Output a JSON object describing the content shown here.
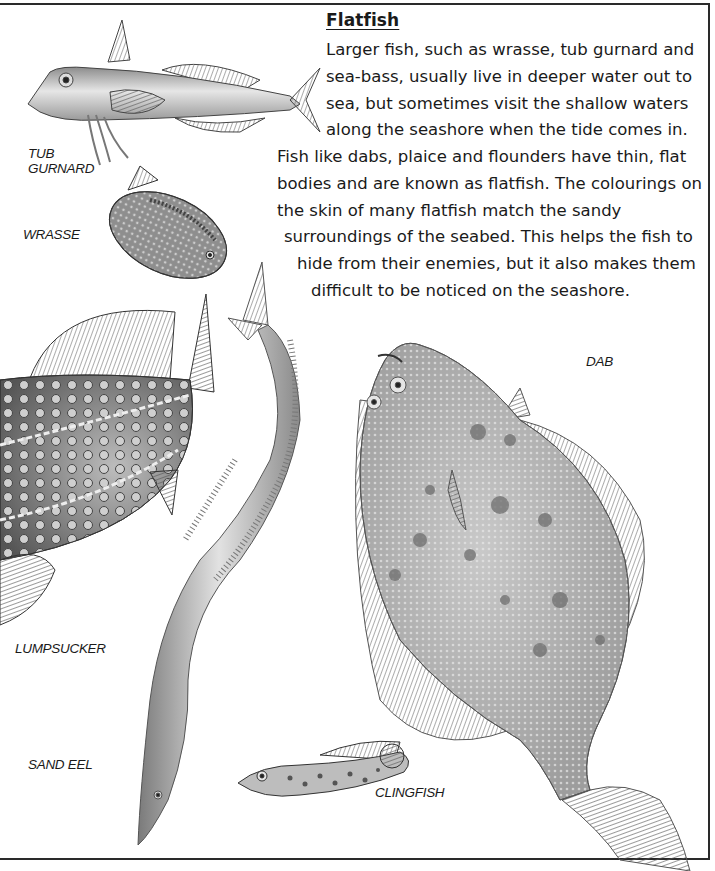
{
  "page": {
    "heading": "Flatfish",
    "paragraph_lines": [
      "Larger fish, such as wrasse, tub gurnard and",
      "sea-bass, usually live in deeper water out to",
      "sea, but sometimes visit the shallow waters",
      "along the seashore when the tide comes in.",
      "Fish like dabs, plaice and flounders have thin, flat",
      "bodies and are known as flatfish. The colourings on",
      "the skin of many flatfish match the sandy",
      "surroundings of the seabed. This helps the fish to",
      "hide from their enemies, but it also makes them",
      "difficult to be noticed on the seashore."
    ]
  },
  "illustrations": [
    {
      "id": "tub-gurnard",
      "label_lines": [
        "TUB",
        "GURNARD"
      ]
    },
    {
      "id": "wrasse",
      "label_lines": [
        "WRASSE"
      ]
    },
    {
      "id": "lumpsucker",
      "label_lines": [
        "LUMPSUCKER"
      ]
    },
    {
      "id": "sand-eel",
      "label_lines": [
        "SAND EEL"
      ]
    },
    {
      "id": "clingfish",
      "label_lines": [
        "CLINGFISH"
      ]
    },
    {
      "id": "dab",
      "label_lines": [
        "DAB"
      ]
    }
  ],
  "colors": {
    "text": "#1a1a1a",
    "frame": "#2a2a2a",
    "fish_light": "#d9d9d9",
    "fish_mid": "#a8a8a8",
    "fish_dark": "#5a5a5a"
  }
}
